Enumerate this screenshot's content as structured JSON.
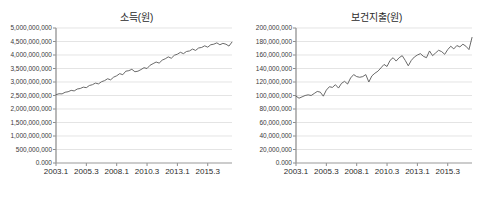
{
  "figure": {
    "background_color": "#ffffff",
    "line_color": "#595959",
    "grid_color": "#d9d9d9",
    "axis_color": "#808080",
    "text_color": "#2b2b2b"
  },
  "chart_data": [
    {
      "id": "income",
      "type": "line",
      "title": "소득(원)",
      "xlabel": "",
      "ylabel": "",
      "grid": true,
      "legend": "none",
      "ylim": [
        0,
        5000000000
      ],
      "ytick_labels": [
        "5,000,000,000",
        "4,500,000,000",
        "4,000,000,000",
        "3,500,000,000",
        "3,000,000,000",
        "2,500,000,000",
        "2,000,000,000",
        "1,500,000,000",
        "1,000,000,000",
        "500,000,000",
        "0.000"
      ],
      "ytick_values": [
        5000000000,
        4500000000,
        4000000000,
        3500000000,
        3000000000,
        2500000000,
        2000000000,
        1500000000,
        1000000000,
        500000000,
        0
      ],
      "xtick_labels": [
        "2003.1",
        "2005.3",
        "2008.1",
        "2010.3",
        "2013.1",
        "2015.3"
      ],
      "xtick_indices": [
        0,
        10,
        20,
        30,
        40,
        50
      ],
      "x": [
        "2003.1",
        "2003.2",
        "2003.3",
        "2003.4",
        "2004.1",
        "2004.2",
        "2004.3",
        "2004.4",
        "2005.1",
        "2005.2",
        "2005.3",
        "2005.4",
        "2006.1",
        "2006.2",
        "2006.3",
        "2006.4",
        "2007.1",
        "2007.2",
        "2007.3",
        "2007.4",
        "2008.1",
        "2008.2",
        "2008.3",
        "2008.4",
        "2009.1",
        "2009.2",
        "2009.3",
        "2009.4",
        "2010.1",
        "2010.2",
        "2010.3",
        "2010.4",
        "2011.1",
        "2011.2",
        "2011.3",
        "2011.4",
        "2012.1",
        "2012.2",
        "2012.3",
        "2012.4",
        "2013.1",
        "2013.2",
        "2013.3",
        "2013.4",
        "2014.1",
        "2014.2",
        "2014.3",
        "2014.4",
        "2015.1",
        "2015.2",
        "2015.3",
        "2015.4",
        "2016.1",
        "2016.2",
        "2016.3",
        "2016.4",
        "2017.1",
        "2017.2",
        "2017.3"
      ],
      "values": [
        2530000000,
        2565000000,
        2560000000,
        2620000000,
        2640000000,
        2690000000,
        2670000000,
        2740000000,
        2760000000,
        2810000000,
        2790000000,
        2870000000,
        2900000000,
        2960000000,
        2930000000,
        3010000000,
        3050000000,
        3120000000,
        3080000000,
        3180000000,
        3230000000,
        3310000000,
        3270000000,
        3400000000,
        3420000000,
        3470000000,
        3380000000,
        3400000000,
        3460000000,
        3530000000,
        3500000000,
        3620000000,
        3680000000,
        3740000000,
        3700000000,
        3810000000,
        3860000000,
        3930000000,
        3880000000,
        3990000000,
        4030000000,
        4100000000,
        4050000000,
        4130000000,
        4150000000,
        4220000000,
        4170000000,
        4260000000,
        4280000000,
        4340000000,
        4290000000,
        4380000000,
        4400000000,
        4450000000,
        4380000000,
        4430000000,
        4400000000,
        4330000000,
        4480000000
      ]
    },
    {
      "id": "health-expenditure",
      "type": "line",
      "title": "보건지출(원)",
      "xlabel": "",
      "ylabel": "",
      "grid": true,
      "legend": "none",
      "ylim": [
        0,
        200000000
      ],
      "ytick_labels": [
        "200,000,000",
        "180,000,000",
        "160,000,000",
        "140,000,000",
        "120,000,000",
        "100,000,000",
        "80,000,000",
        "60,000,000",
        "40,000,000",
        "20,000,000",
        "0.000"
      ],
      "ytick_values": [
        200000000,
        180000000,
        160000000,
        140000000,
        120000000,
        100000000,
        80000000,
        60000000,
        40000000,
        20000000,
        0
      ],
      "xtick_labels": [
        "2003.1",
        "2005.3",
        "2008.1",
        "2010.3",
        "2013.1",
        "2015.3"
      ],
      "xtick_indices": [
        0,
        10,
        20,
        30,
        40,
        50
      ],
      "x": [
        "2003.1",
        "2003.2",
        "2003.3",
        "2003.4",
        "2004.1",
        "2004.2",
        "2004.3",
        "2004.4",
        "2005.1",
        "2005.2",
        "2005.3",
        "2005.4",
        "2006.1",
        "2006.2",
        "2006.3",
        "2006.4",
        "2007.1",
        "2007.2",
        "2007.3",
        "2007.4",
        "2008.1",
        "2008.2",
        "2008.3",
        "2008.4",
        "2009.1",
        "2009.2",
        "2009.3",
        "2009.4",
        "2010.1",
        "2010.2",
        "2010.3",
        "2010.4",
        "2011.1",
        "2011.2",
        "2011.3",
        "2011.4",
        "2012.1",
        "2012.2",
        "2012.3",
        "2012.4",
        "2013.1",
        "2013.2",
        "2013.3",
        "2013.4",
        "2014.1",
        "2014.2",
        "2014.3",
        "2014.4",
        "2015.1",
        "2015.2",
        "2015.3",
        "2015.4",
        "2016.1",
        "2016.2",
        "2016.3",
        "2016.4",
        "2017.1",
        "2017.2",
        "2017.3"
      ],
      "values": [
        99000000,
        96000000,
        98000000,
        100000000,
        101000000,
        100000000,
        103000000,
        106000000,
        105000000,
        99000000,
        108000000,
        113000000,
        112000000,
        116000000,
        111000000,
        118000000,
        121000000,
        117000000,
        126000000,
        131000000,
        128000000,
        127000000,
        128000000,
        131000000,
        120000000,
        129000000,
        133000000,
        136000000,
        141000000,
        146000000,
        143000000,
        152000000,
        156000000,
        151000000,
        156000000,
        159000000,
        152000000,
        144000000,
        152000000,
        157000000,
        160000000,
        162000000,
        158000000,
        156000000,
        166000000,
        159000000,
        163000000,
        167000000,
        165000000,
        161000000,
        168000000,
        173000000,
        169000000,
        174000000,
        172000000,
        176000000,
        173000000,
        168000000,
        186000000
      ]
    }
  ]
}
